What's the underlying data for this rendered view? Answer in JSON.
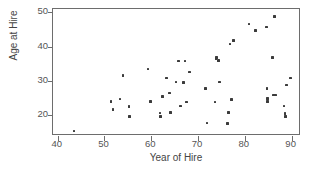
{
  "chart_data": {
    "type": "scatter",
    "title": "",
    "xlabel": "Year of Hire",
    "ylabel": "Age at Hire",
    "xlim": [
      39,
      92
    ],
    "ylim": [
      14,
      51
    ],
    "xticks": [
      40,
      50,
      60,
      70,
      80,
      90
    ],
    "yticks": [
      20,
      30,
      40,
      50
    ],
    "xtick_labels": [
      "40",
      "50",
      "60",
      "70",
      "80",
      "90"
    ],
    "ytick_labels": [
      "20",
      "30",
      "40",
      "50"
    ],
    "grid": false,
    "legend": null,
    "marker": "square",
    "marker_color": "#3b3b3b",
    "frame_color": "#6d6d6d",
    "background": "#ffffff",
    "n_points": 59,
    "points": [
      {
        "x": 43.5,
        "y": 15.5
      },
      {
        "x": 51.4,
        "y": 24.0
      },
      {
        "x": 51.8,
        "y": 21.7
      },
      {
        "x": 53.3,
        "y": 24.8
      },
      {
        "x": 54.0,
        "y": 31.7
      },
      {
        "x": 55.2,
        "y": 22.6
      },
      {
        "x": 55.4,
        "y": 19.6
      },
      {
        "x": 59.3,
        "y": 33.5
      },
      {
        "x": 59.8,
        "y": 24.0
      },
      {
        "x": 61.9,
        "y": 20.7
      },
      {
        "x": 62.0,
        "y": 19.7
      },
      {
        "x": 62.4,
        "y": 25.5
      },
      {
        "x": 63.2,
        "y": 30.9
      },
      {
        "x": 63.9,
        "y": 26.5
      },
      {
        "x": 64.1,
        "y": 20.8
      },
      {
        "x": 65.3,
        "y": 29.7
      },
      {
        "x": 65.8,
        "y": 35.8
      },
      {
        "x": 66.2,
        "y": 22.7
      },
      {
        "x": 66.9,
        "y": 29.6
      },
      {
        "x": 67.2,
        "y": 35.8
      },
      {
        "x": 67.5,
        "y": 23.9
      },
      {
        "x": 68.2,
        "y": 32.7
      },
      {
        "x": 71.6,
        "y": 27.9
      },
      {
        "x": 71.9,
        "y": 17.8
      },
      {
        "x": 73.6,
        "y": 23.9
      },
      {
        "x": 73.8,
        "y": 36.6
      },
      {
        "x": 73.9,
        "y": 36.9
      },
      {
        "x": 74.4,
        "y": 36.0
      },
      {
        "x": 74.6,
        "y": 29.7
      },
      {
        "x": 76.3,
        "y": 17.7
      },
      {
        "x": 76.5,
        "y": 20.8
      },
      {
        "x": 76.8,
        "y": 40.8
      },
      {
        "x": 77.2,
        "y": 24.7
      },
      {
        "x": 77.6,
        "y": 41.8
      },
      {
        "x": 80.9,
        "y": 46.6
      },
      {
        "x": 82.3,
        "y": 44.8
      },
      {
        "x": 84.6,
        "y": 45.8
      },
      {
        "x": 84.7,
        "y": 27.8
      },
      {
        "x": 84.8,
        "y": 25.0
      },
      {
        "x": 84.9,
        "y": 24.0
      },
      {
        "x": 85.9,
        "y": 36.8
      },
      {
        "x": 86.1,
        "y": 25.9
      },
      {
        "x": 86.4,
        "y": 48.8
      },
      {
        "x": 86.6,
        "y": 25.9
      },
      {
        "x": 88.4,
        "y": 22.7
      },
      {
        "x": 88.6,
        "y": 20.6
      },
      {
        "x": 88.7,
        "y": 19.6
      },
      {
        "x": 88.9,
        "y": 28.8
      },
      {
        "x": 89.8,
        "y": 30.9
      }
    ]
  },
  "axes": {
    "xlabel": "Year of Hire",
    "ylabel": "Age at Hire",
    "xtick_labels": [
      "40",
      "50",
      "60",
      "70",
      "80",
      "90"
    ],
    "ytick_labels": [
      "50",
      "40",
      "30",
      "20"
    ]
  }
}
